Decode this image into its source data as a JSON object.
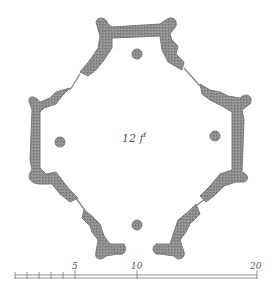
{
  "diagram": {
    "type": "architectural-floor-plan",
    "room_label": "12",
    "room_label_unit": "f",
    "room_label_sup": "t",
    "wall_color": "#8a8a8a",
    "scale_bar": {
      "labels": [
        "5",
        "10",
        "20"
      ],
      "ticks_minor": 5
    }
  }
}
